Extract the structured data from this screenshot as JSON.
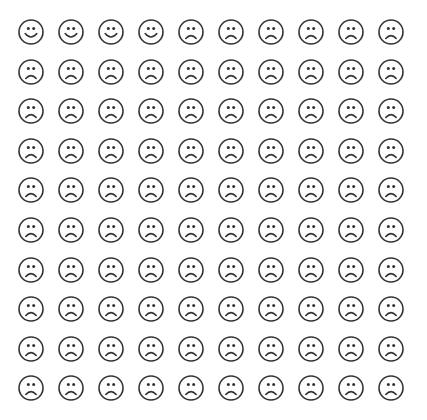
{
  "figure": {
    "rows": 10,
    "cols": 10,
    "stroke_color": "#333333",
    "background": "#ffffff",
    "happy_count": 4,
    "sad_count": 96,
    "faces": [
      "happy",
      "happy",
      "happy",
      "happy",
      "sad",
      "sad",
      "sad",
      "sad",
      "sad",
      "sad",
      "sad",
      "sad",
      "sad",
      "sad",
      "sad",
      "sad",
      "sad",
      "sad",
      "sad",
      "sad",
      "sad",
      "sad",
      "sad",
      "sad",
      "sad",
      "sad",
      "sad",
      "sad",
      "sad",
      "sad",
      "sad",
      "sad",
      "sad",
      "sad",
      "sad",
      "sad",
      "sad",
      "sad",
      "sad",
      "sad",
      "sad",
      "sad",
      "sad",
      "sad",
      "sad",
      "sad",
      "sad",
      "sad",
      "sad",
      "sad",
      "sad",
      "sad",
      "sad",
      "sad",
      "sad",
      "sad",
      "sad",
      "sad",
      "sad",
      "sad",
      "sad",
      "sad",
      "sad",
      "sad",
      "sad",
      "sad",
      "sad",
      "sad",
      "sad",
      "sad",
      "sad",
      "sad",
      "sad",
      "sad",
      "sad",
      "sad",
      "sad",
      "sad",
      "sad",
      "sad",
      "sad",
      "sad",
      "sad",
      "sad",
      "sad",
      "sad",
      "sad",
      "sad",
      "sad",
      "sad",
      "sad",
      "sad",
      "sad",
      "sad",
      "sad",
      "sad",
      "sad",
      "sad",
      "sad",
      "sad"
    ],
    "icons": {
      "happy": "smiling-face-icon",
      "sad": "frowning-face-icon"
    }
  }
}
